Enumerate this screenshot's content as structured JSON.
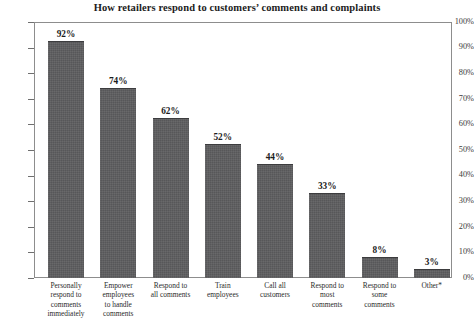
{
  "chart_data": {
    "type": "bar",
    "title": "How retailers respond to customers’ comments and complaints",
    "xlabel": "",
    "ylabel": "",
    "ylim": [
      0,
      100
    ],
    "ytick_labels": [
      "100%",
      "90%",
      "80%",
      "70%",
      "60%",
      "50%",
      "40%",
      "30%",
      "20%",
      "10%",
      "0%"
    ],
    "ytick_values": [
      100,
      90,
      80,
      70,
      60,
      50,
      40,
      30,
      20,
      10,
      0
    ],
    "grid": false,
    "legend": null,
    "categories": [
      "Personally respond to comments immediately",
      "Empower employees to handle comments",
      "Respond to all comments",
      "Train employees",
      "Call all customers",
      "Respond to most comments",
      "Respond to some comments",
      "Other*"
    ],
    "category_lines": [
      [
        "Personally",
        "respond to",
        "comments",
        "immediately"
      ],
      [
        "Empower",
        "employees",
        "to handle",
        "comments"
      ],
      [
        "Respond to",
        "all comments"
      ],
      [
        "Train",
        "employees"
      ],
      [
        "Call all",
        "customers"
      ],
      [
        "Respond to",
        "most",
        "comments"
      ],
      [
        "Respond to",
        "some",
        "comments"
      ],
      [
        "Other*"
      ]
    ],
    "values": [
      92,
      74,
      62,
      52,
      44,
      33,
      8,
      3
    ],
    "value_labels": [
      "92%",
      "74%",
      "62%",
      "52%",
      "44%",
      "33%",
      "8%",
      "3%"
    ],
    "bar_color": "#575759",
    "frame_color": "#8d8d8d",
    "background_color": "#ffffff"
  }
}
